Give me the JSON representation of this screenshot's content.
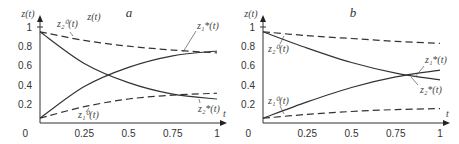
{
  "chart_data": [
    {
      "type": "line",
      "title": "a",
      "xlabel": "t",
      "ylabel": "z(t)",
      "extra_annotation": "z(t)",
      "xlim": [
        0,
        1
      ],
      "ylim": [
        0,
        1
      ],
      "x_ticks": [
        "0.25",
        "0.5",
        "0.75",
        "1"
      ],
      "y_ticks": [
        "0.2",
        "0.4",
        "0.6",
        "0.8",
        "1"
      ],
      "origin_label": "0",
      "grid": false,
      "x": [
        0,
        0.25,
        0.5,
        0.75,
        1
      ],
      "series": [
        {
          "name": "z2^0(t)",
          "label": "z₂⁰(t)",
          "style": "dashed",
          "values": [
            0.95,
            0.86,
            0.8,
            0.76,
            0.73
          ]
        },
        {
          "name": "z2*(t)",
          "label": "z₂*(t)",
          "style": "solid",
          "values": [
            0.95,
            0.62,
            0.42,
            0.3,
            0.25
          ]
        },
        {
          "name": "z1*(t)",
          "label": "z₁*(t)",
          "style": "solid",
          "values": [
            0.05,
            0.38,
            0.58,
            0.7,
            0.75
          ]
        },
        {
          "name": "z1^0(t)",
          "label": "z₁⁰(t)",
          "style": "dashed",
          "values": [
            0.05,
            0.17,
            0.25,
            0.29,
            0.31
          ]
        }
      ]
    },
    {
      "type": "line",
      "title": "b",
      "xlabel": "t",
      "ylabel": "z(t)",
      "xlim": [
        0,
        1
      ],
      "ylim": [
        0,
        1
      ],
      "x_ticks": [
        "0.25",
        "0.5",
        "0.75",
        "1"
      ],
      "y_ticks": [
        "0.2",
        "0.4",
        "0.6",
        "0.8",
        "1"
      ],
      "origin_label": "0",
      "grid": false,
      "x": [
        0,
        0.25,
        0.5,
        0.75,
        1
      ],
      "series": [
        {
          "name": "z2^0(t)",
          "label": "z₂⁰(t)",
          "style": "dashed",
          "values": [
            0.95,
            0.91,
            0.88,
            0.85,
            0.83
          ]
        },
        {
          "name": "z2*(t)",
          "label": "z₂*(t)",
          "style": "solid",
          "values": [
            0.95,
            0.78,
            0.63,
            0.52,
            0.45
          ]
        },
        {
          "name": "z1*(t)",
          "label": "z₁*(t)",
          "style": "solid",
          "values": [
            0.05,
            0.22,
            0.37,
            0.48,
            0.55
          ]
        },
        {
          "name": "z1^0(t)",
          "label": "z₁⁰(t)",
          "style": "dashed",
          "values": [
            0.05,
            0.09,
            0.12,
            0.14,
            0.15
          ]
        }
      ]
    }
  ]
}
